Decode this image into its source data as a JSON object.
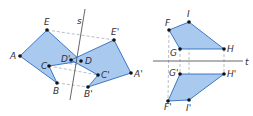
{
  "colors": {
    "fill": "#a9c9ef",
    "stroke": "#2d6cbf",
    "axis": "#555555",
    "dash": "#9aa4b2",
    "point": "#111111"
  },
  "figure_left": {
    "axis": {
      "label": "s",
      "x1": 85,
      "y1": 9,
      "x2": 70,
      "y2": 100,
      "label_x": 77,
      "label_y": 24
    },
    "original": {
      "points": [
        {
          "name": "A",
          "x": 20,
          "y": 56,
          "lx": 10,
          "ly": 59
        },
        {
          "name": "E",
          "x": 47,
          "y": 30,
          "lx": 44,
          "ly": 25
        },
        {
          "name": "D",
          "x": 81,
          "y": 61,
          "lx": 85,
          "ly": 64
        },
        {
          "name": "C",
          "x": 49,
          "y": 66,
          "lx": 41,
          "ly": 69
        },
        {
          "name": "B",
          "x": 57,
          "y": 83,
          "lx": 53,
          "ly": 94
        }
      ]
    },
    "image": {
      "points": [
        {
          "name": "A'",
          "x": 131,
          "y": 73,
          "lx": 134,
          "ly": 77
        },
        {
          "name": "E'",
          "x": 114,
          "y": 40,
          "lx": 111,
          "ly": 35
        },
        {
          "name": "D'",
          "x": 71,
          "y": 60,
          "lx": 61,
          "ly": 62
        },
        {
          "name": "C'",
          "x": 98,
          "y": 75,
          "lx": 101,
          "ly": 78
        },
        {
          "name": "B'",
          "x": 88,
          "y": 87,
          "lx": 84,
          "ly": 97
        }
      ]
    }
  },
  "figure_right": {
    "axis": {
      "label": "t",
      "x1": 153,
      "y1": 61,
      "x2": 243,
      "y2": 61,
      "label_x": 245,
      "label_y": 65
    },
    "original": {
      "points": [
        {
          "name": "F",
          "x": 169,
          "y": 30,
          "lx": 165,
          "ly": 26
        },
        {
          "name": "I",
          "x": 189,
          "y": 22,
          "lx": 187,
          "ly": 17
        },
        {
          "name": "H",
          "x": 224,
          "y": 49,
          "lx": 227,
          "ly": 52
        },
        {
          "name": "G",
          "x": 180,
          "y": 49,
          "lx": 170,
          "ly": 56
        }
      ]
    },
    "image": {
      "points": [
        {
          "name": "G'",
          "x": 180,
          "y": 74,
          "lx": 169,
          "ly": 76
        },
        {
          "name": "H'",
          "x": 224,
          "y": 74,
          "lx": 227,
          "ly": 77
        },
        {
          "name": "I'",
          "x": 189,
          "y": 100,
          "lx": 186,
          "ly": 111
        },
        {
          "name": "F'",
          "x": 168,
          "y": 101,
          "lx": 164,
          "ly": 110
        }
      ]
    }
  }
}
